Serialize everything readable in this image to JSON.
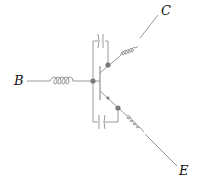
{
  "diagram": {
    "type": "transistor-equivalent-circuit",
    "terminals": {
      "base": "B",
      "collector": "C",
      "emitter": "E"
    },
    "components": [
      "base-inductor",
      "collector-inductor",
      "emitter-inductor",
      "base-collector-capacitor",
      "base-emitter-capacitor",
      "transistor"
    ],
    "colors": {
      "wire": "#9a9a9a",
      "node": "#7a7a7a",
      "label": "#111111",
      "background": "#ffffff"
    }
  }
}
